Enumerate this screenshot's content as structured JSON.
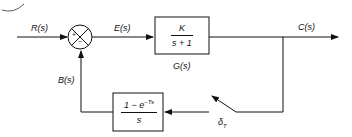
{
  "diagram": {
    "type": "closed-loop control block diagram",
    "signals": {
      "input": "R(s)",
      "error": "E(s)",
      "output": "C(s)",
      "feedback": "B(s)"
    },
    "summing_junction": {
      "plus_sign": "+",
      "minus_sign": "−"
    },
    "forward_block": {
      "numerator": "K",
      "denominator": "s + 1",
      "name": "G(s)"
    },
    "feedback_block": {
      "numerator_base": "1 − e",
      "numerator_exp": "−Ts",
      "denominator": "s"
    },
    "sampler": {
      "label_base": "δ",
      "label_sub": "T"
    }
  }
}
